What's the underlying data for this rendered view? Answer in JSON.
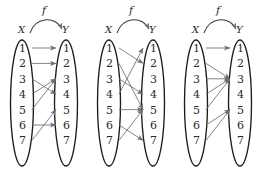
{
  "figure": {
    "background_color": "#ffffff",
    "oval_stroke_color": "#1c1c1c",
    "arrow_color": "#6e6e6e",
    "label_color": "#2b2b2b",
    "domain_label": "X",
    "codomain_label": "Y",
    "function_label": "f",
    "elements": [
      "1",
      "2",
      "3",
      "4",
      "5",
      "6",
      "7"
    ]
  },
  "diagrams": [
    {
      "id": "diagram-1",
      "domain_label": "X",
      "codomain_label": "Y",
      "function_label": "f",
      "domain_elements": [
        "1",
        "2",
        "3",
        "4",
        "5",
        "6",
        "7"
      ],
      "codomain_elements": [
        "1",
        "2",
        "3",
        "4",
        "5",
        "6",
        "7"
      ],
      "mappings": [
        {
          "from": "1",
          "to": "1"
        },
        {
          "from": "2",
          "to": "2"
        },
        {
          "from": "3",
          "to": "4"
        },
        {
          "from": "4",
          "to": "3"
        },
        {
          "from": "5",
          "to": "3"
        },
        {
          "from": "6",
          "to": "6"
        },
        {
          "from": "7",
          "to": "5"
        }
      ]
    },
    {
      "id": "diagram-2",
      "domain_label": "X",
      "codomain_label": "Y",
      "function_label": "f",
      "domain_elements": [
        "1",
        "2",
        "3",
        "4",
        "5",
        "6",
        "7"
      ],
      "codomain_elements": [
        "1",
        "2",
        "3",
        "4",
        "5",
        "6",
        "7"
      ],
      "mappings": [
        {
          "from": "1",
          "to": "2"
        },
        {
          "from": "2",
          "to": "5"
        },
        {
          "from": "3",
          "to": "4"
        },
        {
          "from": "4",
          "to": "1"
        },
        {
          "from": "5",
          "to": "5"
        },
        {
          "from": "6",
          "to": "7"
        },
        {
          "from": "7",
          "to": "5"
        }
      ]
    },
    {
      "id": "diagram-3",
      "domain_label": "X",
      "codomain_label": "Y",
      "function_label": "f",
      "domain_elements": [
        "1",
        "2",
        "3",
        "4",
        "5",
        "6",
        "7"
      ],
      "codomain_elements": [
        "1",
        "2",
        "3",
        "4",
        "5",
        "6",
        "7"
      ],
      "mappings": [
        {
          "from": "1",
          "to": "1"
        },
        {
          "from": "2",
          "to": "3"
        },
        {
          "from": "3",
          "to": "3"
        },
        {
          "from": "4",
          "to": "3"
        },
        {
          "from": "5",
          "to": "3"
        },
        {
          "from": "6",
          "to": "5"
        },
        {
          "from": "7",
          "to": "5"
        }
      ]
    }
  ]
}
